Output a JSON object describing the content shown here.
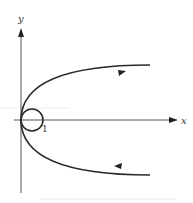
{
  "diagram": {
    "type": "phase-portrait",
    "axes": {
      "x_label": "x",
      "y_label": "y"
    },
    "circle": {
      "label": "1",
      "tangent_point": "origin"
    },
    "curve": {
      "shape": "parabola",
      "opening": "right",
      "upper_branch_direction": "outward",
      "lower_branch_direction": "inward"
    },
    "colors": {
      "stroke": "#2a2a2a",
      "axis": "#555555",
      "background": "#ffffff"
    }
  }
}
